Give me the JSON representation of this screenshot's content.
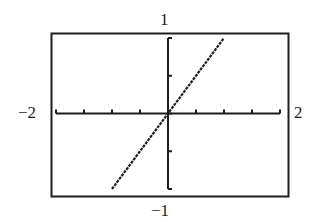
{
  "chart_data": {
    "type": "line",
    "title": "",
    "xlabel": "",
    "ylabel": "",
    "xlim": [
      -2,
      2
    ],
    "ylim": [
      -1,
      1
    ],
    "x_scale": 0.5,
    "y_scale": 0.5,
    "grid": false,
    "legend": null,
    "window_labels": {
      "xmin": "−2",
      "xmax": "2",
      "ymin": "−1",
      "ymax": "1"
    },
    "x_ticks": [
      -2,
      -1.5,
      -1,
      -0.5,
      0,
      0.5,
      1,
      1.5,
      2
    ],
    "y_ticks": [
      -1,
      -0.5,
      0,
      0.5,
      1
    ],
    "series": [
      {
        "name": "y = x",
        "style": "dotted-pixel",
        "x": [
          -1,
          0,
          1
        ],
        "y": [
          -1,
          0,
          1
        ]
      }
    ]
  },
  "colors": {
    "ink": "#1e1e1e",
    "background": "#ffffff"
  }
}
